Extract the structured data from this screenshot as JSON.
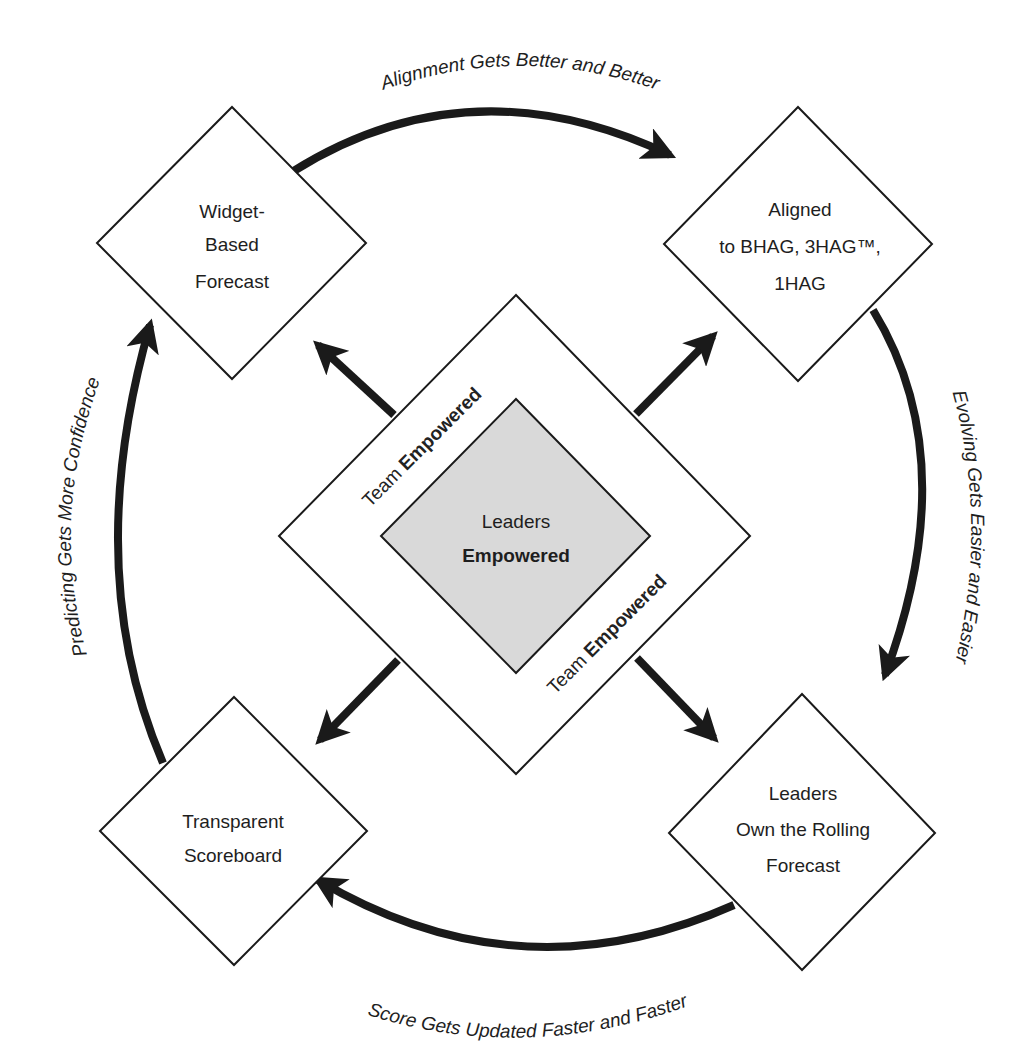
{
  "diagram": {
    "center": {
      "label_line1": "Leaders",
      "label_line2": "Empowered",
      "fill": "#d9d9d9"
    },
    "ring": {
      "label_top_left_prefix": "Team ",
      "label_top_left_bold": "Empowered",
      "label_bottom_right_prefix": "Team ",
      "label_bottom_right_bold": "Empowered"
    },
    "nodes": {
      "top_left": {
        "line1": "Widget-",
        "line2": "Based",
        "line3": "Forecast"
      },
      "top_right": {
        "line1": "Aligned",
        "line2": "to BHAG, 3HAG™,",
        "line3": "1HAG"
      },
      "bottom_right": {
        "line1": "Leaders",
        "line2": "Own the Rolling",
        "line3": "Forecast"
      },
      "bottom_left": {
        "line1": "Transparent",
        "line2": "Scoreboard"
      }
    },
    "cycle_labels": {
      "top": "Alignment Gets Better and Better",
      "right": "Evolving Gets Easier and Easier",
      "bottom": "Score Gets Updated Faster and Faster",
      "left": "Predicting Gets More Confidence"
    },
    "colors": {
      "stroke": "#1a1a1a",
      "background": "#ffffff"
    }
  }
}
